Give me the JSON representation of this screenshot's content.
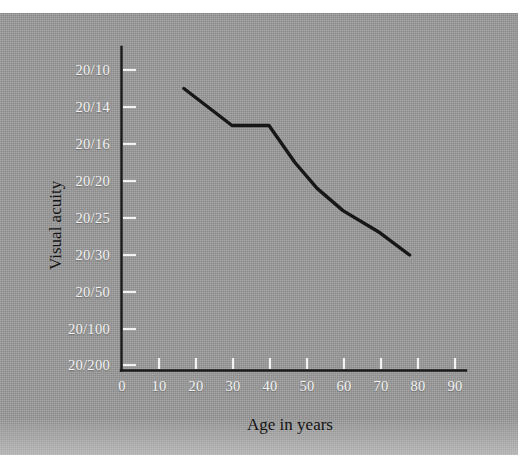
{
  "figure": {
    "background_color": "#9b9b9b",
    "ink_color": "#171717",
    "tick_label_color": "#f4f4f4"
  },
  "chart_data": {
    "type": "line",
    "title": "",
    "xlabel": "Age in years",
    "ylabel": "Visual acuity",
    "grid": false,
    "legend": "none",
    "xlim": [
      0,
      95
    ],
    "x_ticks": [
      0,
      10,
      20,
      30,
      40,
      50,
      60,
      70,
      80,
      90
    ],
    "x_tick_labels": [
      "0",
      "10",
      "20",
      "30",
      "40",
      "50",
      "60",
      "70",
      "80",
      "90"
    ],
    "y_categories_top_to_bottom": [
      "20/10",
      "20/14",
      "20/16",
      "20/20",
      "20/25",
      "20/30",
      "20/50",
      "20/100",
      "20/200"
    ],
    "y_tick_labels": [
      "20/10",
      "20/14",
      "20/16",
      "20/20",
      "20/25",
      "20/30",
      "20/50",
      "20/100",
      "20/200"
    ],
    "series": [
      {
        "name": "Visual acuity by age",
        "x": [
          17,
          30,
          40,
          47,
          53,
          60,
          70,
          78
        ],
        "y_labels": [
          "20/12",
          "20/15",
          "20/15",
          "20/18",
          "20/21",
          "20/24",
          "20/27",
          "20/30"
        ],
        "values": [
          {
            "age": 17,
            "acuity": "20/12"
          },
          {
            "age": 30,
            "acuity": "20/15"
          },
          {
            "age": 40,
            "acuity": "20/15"
          },
          {
            "age": 47,
            "acuity": "20/18"
          },
          {
            "age": 53,
            "acuity": "20/21"
          },
          {
            "age": 60,
            "acuity": "20/24"
          },
          {
            "age": 70,
            "acuity": "20/27"
          },
          {
            "age": 78,
            "acuity": "20/30"
          }
        ]
      }
    ]
  }
}
